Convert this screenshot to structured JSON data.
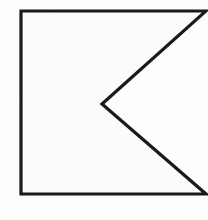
{
  "figure": {
    "name": "guidon-chevron-outline",
    "shape_type": "polygon-outline",
    "stroke_color": "#1a1a1a",
    "fill_color": "#fbfbfb",
    "background_color": "#fdfdfd",
    "stroke_width": 3.2,
    "canvas": {
      "width": 208,
      "height": 220
    },
    "vertices": [
      {
        "name": "top-left",
        "x": 21,
        "y": 11
      },
      {
        "name": "top-right",
        "x": 206,
        "y": 11
      },
      {
        "name": "notch-vertex",
        "x": 102,
        "y": 104
      },
      {
        "name": "bottom-right",
        "x": 206,
        "y": 194
      },
      {
        "name": "bottom-left",
        "x": 21,
        "y": 194
      }
    ],
    "edges": [
      {
        "name": "top-edge",
        "from": "top-left",
        "to": "top-right",
        "orientation": "horizontal"
      },
      {
        "name": "upper-notch-diagonal",
        "from": "top-right",
        "to": "notch-vertex",
        "orientation": "diagonal"
      },
      {
        "name": "lower-notch-diagonal",
        "from": "notch-vertex",
        "to": "bottom-right",
        "orientation": "diagonal"
      },
      {
        "name": "bottom-edge",
        "from": "bottom-right",
        "to": "bottom-left",
        "orientation": "horizontal"
      },
      {
        "name": "left-edge",
        "from": "bottom-left",
        "to": "top-left",
        "orientation": "vertical"
      }
    ]
  }
}
